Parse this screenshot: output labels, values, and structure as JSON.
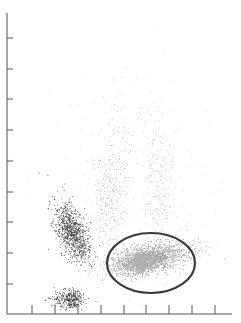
{
  "chart_data": {
    "type": "scatter",
    "title": "",
    "xlabel": "",
    "ylabel": "",
    "grid": false,
    "legend": null,
    "axes": {
      "origin_px": [
        7,
        314
      ],
      "x_end_px": 232,
      "y_top_px": 13,
      "x_ticks_px": [
        32,
        55,
        78,
        101,
        124,
        146,
        169,
        192,
        215
      ],
      "y_ticks_px": [
        38,
        69,
        99,
        130,
        161,
        192,
        222,
        253,
        284
      ],
      "x_tick_labels": [],
      "y_tick_labels": []
    },
    "populations": [
      {
        "name": "dense-dark-cluster",
        "color": "#2a2a2a",
        "cx": 72,
        "cy": 232,
        "sx": 7,
        "sy": 16,
        "rot": -0.35,
        "n": 900,
        "r": 0.8
      },
      {
        "name": "bottom-dark-cluster",
        "color": "#2a2a2a",
        "cx": 70,
        "cy": 299,
        "sx": 8,
        "sy": 5,
        "rot": 0,
        "n": 350,
        "r": 0.8
      },
      {
        "name": "gated-gray-population",
        "color": "#9a9a9a",
        "cx": 150,
        "cy": 258,
        "sx": 20,
        "sy": 7,
        "rot": -0.2,
        "n": 1400,
        "r": 0.9
      },
      {
        "name": "gated-gray-core",
        "color": "#b0b0b0",
        "cx": 140,
        "cy": 262,
        "sx": 10,
        "sy": 5,
        "rot": -0.3,
        "n": 600,
        "r": 1.2
      },
      {
        "name": "diagonal-sparse-stream",
        "color": "#777777",
        "cx": 110,
        "cy": 190,
        "sx": 9,
        "sy": 35,
        "rot": 0.05,
        "n": 350,
        "r": 0.6
      },
      {
        "name": "right-sparse-stream",
        "color": "#888888",
        "cx": 158,
        "cy": 180,
        "sx": 8,
        "sy": 38,
        "rot": -0.1,
        "n": 260,
        "r": 0.6
      },
      {
        "name": "background-scatter",
        "color": "#999999",
        "cx": 130,
        "cy": 200,
        "sx": 45,
        "sy": 60,
        "rot": 0,
        "n": 220,
        "r": 0.5
      }
    ],
    "gate": {
      "shape": "ellipse",
      "cx": 151,
      "cy": 263,
      "rx": 44,
      "ry": 30,
      "stroke": "#3a3a3a",
      "stroke_width": 2.2
    }
  },
  "header": {
    "truncated_text": "— — — — — — — — — — — —"
  },
  "colors": {
    "axis": "#555555",
    "background": "#ffffff"
  }
}
